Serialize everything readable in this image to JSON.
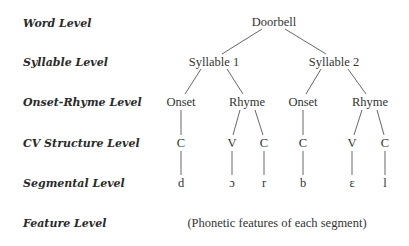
{
  "levels": [
    {
      "label": "Word Level"
    },
    {
      "label": "Syllable Level"
    },
    {
      "label": "Onset-Rhyme Level"
    },
    {
      "label": "CV Structure Level"
    },
    {
      "label": "Segmental Level"
    },
    {
      "label": "Feature Level"
    }
  ],
  "tree": {
    "word": "Doorbell",
    "syllables": [
      "Syllable 1",
      "Syllable 2"
    ],
    "onset_rhyme": [
      "Onset",
      "Rhyme",
      "Onset",
      "Rhyme"
    ],
    "cv": [
      "C",
      "V",
      "C",
      "C",
      "V",
      "C"
    ],
    "segments": [
      "d",
      "ɔ",
      "r",
      "b",
      "ɛ",
      "l"
    ],
    "features": "(Phonetic features of each segment)"
  }
}
